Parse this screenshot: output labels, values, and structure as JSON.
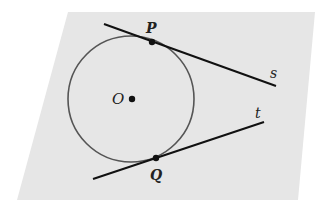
{
  "diagram": {
    "type": "geometry",
    "plane": {
      "fill": "#e6e6e6",
      "points": [
        [
          68,
          12
        ],
        [
          315,
          12
        ],
        [
          298,
          200
        ],
        [
          17,
          200
        ]
      ]
    },
    "circle": {
      "label": "O",
      "center": [
        131,
        99
      ],
      "radius": 63,
      "stroke": "#555555"
    },
    "points": [
      {
        "id": "O",
        "label": "O",
        "x": 131,
        "y": 99
      },
      {
        "id": "P",
        "label": "P",
        "x": 152,
        "y": 42
      },
      {
        "id": "Q",
        "label": "Q",
        "x": 156,
        "y": 158
      }
    ],
    "lines": [
      {
        "id": "s",
        "label": "s",
        "x1": 104,
        "y1": 24,
        "x2": 276,
        "y2": 86
      },
      {
        "id": "t",
        "label": "t",
        "x1": 93,
        "y1": 179,
        "x2": 264,
        "y2": 122
      }
    ],
    "labels": {
      "O": "O",
      "P": "P",
      "Q": "Q",
      "s": "s",
      "t": "t"
    }
  }
}
